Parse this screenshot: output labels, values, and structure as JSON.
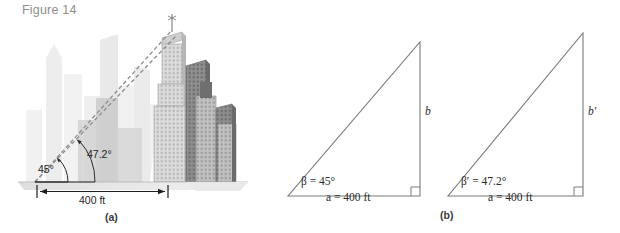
{
  "figure": {
    "title": "Figure 14",
    "title_color": "#8e8e8e",
    "background": "#ffffff"
  },
  "panel_a": {
    "caption": "(a)",
    "scene": "city-skyline",
    "angle_lower": "45°",
    "angle_upper": "47.2°",
    "baseline_label": "400 ft",
    "line_color": "#6e6e6e",
    "building_light": "#e3e3e3",
    "building_mid": "#c9c9c9",
    "building_dark": "#8c8c8c"
  },
  "panel_b": {
    "caption": "(b)",
    "stroke_color": "#7a7a7a",
    "triangle_1": {
      "angle_label": "β = 45°",
      "base_label": "a = 400 ft",
      "height_label": "b",
      "angle_deg": 45,
      "base_ft": 400
    },
    "triangle_2": {
      "angle_label": "β′ = 47.2°",
      "base_label": "a = 400 ft",
      "height_label": "b′",
      "angle_deg": 47.2,
      "base_ft": 400
    }
  }
}
